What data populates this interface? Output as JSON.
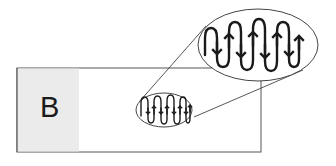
{
  "diagram": {
    "panel_label": "B",
    "colors": {
      "background": "#ffffff",
      "panel_fill": "#ebebeb",
      "outline": "#555555",
      "waveform": "#1a1a1a",
      "label": "#1a1a1a"
    },
    "outer_rect": {
      "x": 17,
      "y": 68,
      "width": 244,
      "height": 84
    },
    "label_panel": {
      "x": 17,
      "y": 68,
      "width": 62,
      "height": 84
    },
    "small_ellipse": {
      "cx": 164,
      "cy": 110,
      "rx": 28,
      "ry": 17
    },
    "large_ellipse": {
      "cx": 258,
      "cy": 45,
      "rx": 60,
      "ry": 36
    },
    "connector_lines": [
      {
        "x1": 139,
        "y1": 102,
        "x2": 206,
        "y2": 26
      },
      {
        "x1": 194,
        "y1": 117,
        "x2": 303,
        "y2": 70
      }
    ],
    "waveform": {
      "description": "serpentine coiled path with alternating up/down direction arrows",
      "arrow_directions": [
        "down",
        "up",
        "down",
        "up",
        "down",
        "up",
        "down",
        "up"
      ]
    }
  }
}
